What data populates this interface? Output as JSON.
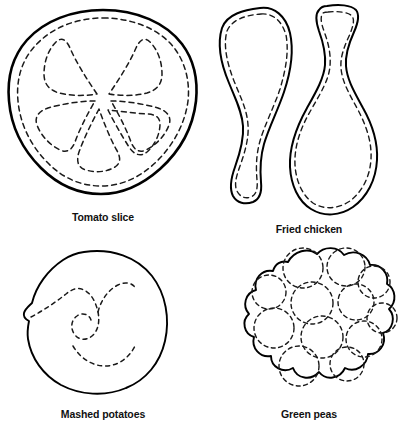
{
  "page": {
    "background_color": "#ffffff",
    "ink_color": "#000000",
    "width": 412,
    "height": 431
  },
  "figures": [
    {
      "id": "tomato-slice",
      "label": "Tomato slice",
      "icon_name": "tomato-slice-figure",
      "description": "Round slice with six dashed teardrop seed segments radiating from the center and a dashed inner rind ring",
      "outline_style": "solid",
      "inner_style": "dashed",
      "segment_count": 6
    },
    {
      "id": "fried-chicken",
      "label": "Fried chicken",
      "icon_name": "fried-chicken-figure",
      "description": "Two drumstick silhouettes side by side, each with a dashed inner contour",
      "outline_style": "solid",
      "inner_style": "dashed",
      "piece_count": 2
    },
    {
      "id": "mashed-potatoes",
      "label": "Mashed potatoes",
      "icon_name": "mashed-potatoes-figure",
      "description": "Rounded mound outline with a dashed spiral swirl inside",
      "outline_style": "solid",
      "inner_style": "dashed",
      "swirl_count": 1
    },
    {
      "id": "green-peas",
      "label": "Green peas",
      "icon_name": "green-peas-figure",
      "description": "Scalloped cluster outline enclosing twelve dashed circular peas",
      "outline_style": "solid",
      "inner_style": "dashed",
      "pea_count": 12
    }
  ]
}
